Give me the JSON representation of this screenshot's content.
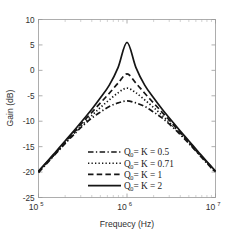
{
  "chart_data": {
    "type": "line",
    "title": "",
    "xlabel": "Frequecy (Hz)",
    "ylabel": "Gain (dB)",
    "xscale": "log",
    "yscale": "linear",
    "xlim": [
      100000,
      10000000
    ],
    "ylim": [
      -25,
      10
    ],
    "grid": false,
    "legend_position": "lower center",
    "xticks": [
      {
        "value": 100000,
        "label": "10",
        "exponent": "5"
      },
      {
        "value": 1000000,
        "label": "10",
        "exponent": "6"
      },
      {
        "value": 10000000,
        "label": "10",
        "exponent": "7"
      }
    ],
    "yticks": [
      10,
      5,
      0,
      -5,
      -10,
      -15,
      -20,
      -25
    ],
    "x": [
      100000,
      125893,
      158489,
      199526,
      251189,
      316228,
      398107,
      501187,
      630957,
      794328,
      1000000,
      1258925,
      1584893,
      1995262,
      2511886,
      3162278,
      3981072,
      5011872,
      6309573,
      7943282,
      10000000
    ],
    "series": [
      {
        "name": "Q_0 = K = 0.5",
        "label_prefix": "Q",
        "label_sub": "0",
        "label_suffix": " = K = 0.5",
        "style": "dashdot",
        "peak_value": -6.0,
        "values": [
          -20.1,
          -18.2,
          -16.3,
          -14.4,
          -12.6,
          -10.9,
          -9.4,
          -8.2,
          -7.1,
          -6.4,
          -6.0,
          -6.4,
          -7.1,
          -8.2,
          -9.4,
          -10.9,
          -12.6,
          -14.4,
          -16.3,
          -18.2,
          -20.1
        ]
      },
      {
        "name": "Q_0 = K = 0.71",
        "label_prefix": "Q",
        "label_sub": "0",
        "label_suffix": " = K = 0.71",
        "style": "dotted",
        "peak_value": -3.5,
        "values": [
          -20.0,
          -18.1,
          -16.2,
          -14.3,
          -12.4,
          -10.6,
          -8.9,
          -7.3,
          -5.8,
          -4.4,
          -3.5,
          -4.4,
          -5.8,
          -7.3,
          -8.9,
          -10.6,
          -12.4,
          -14.3,
          -16.2,
          -18.1,
          -20.0
        ]
      },
      {
        "name": "Q_0 = K = 1",
        "label_prefix": "Q",
        "label_sub": "0",
        "label_suffix": " = K = 1",
        "style": "dashed",
        "peak_value": -0.7,
        "values": [
          -19.9,
          -18.0,
          -16.1,
          -14.1,
          -12.2,
          -10.2,
          -8.3,
          -6.4,
          -4.5,
          -2.5,
          -0.7,
          -2.5,
          -4.5,
          -6.4,
          -8.3,
          -10.2,
          -12.2,
          -14.1,
          -16.1,
          -18.0,
          -19.9
        ]
      },
      {
        "name": "Q_0 = K = 2",
        "label_prefix": "Q",
        "label_sub": "0",
        "label_suffix": " = K = 2",
        "style": "solid",
        "peak_value": 5.5,
        "values": [
          -19.8,
          -17.9,
          -15.9,
          -13.9,
          -11.9,
          -9.8,
          -7.7,
          -5.4,
          -2.9,
          0.6,
          5.5,
          0.6,
          -2.9,
          -5.4,
          -7.7,
          -9.8,
          -11.9,
          -13.9,
          -15.9,
          -17.9,
          -19.8
        ]
      }
    ]
  },
  "colors": {
    "curve": "#151515",
    "axis": "#9a9a9a",
    "text": "#303030",
    "background": "#ffffff"
  }
}
